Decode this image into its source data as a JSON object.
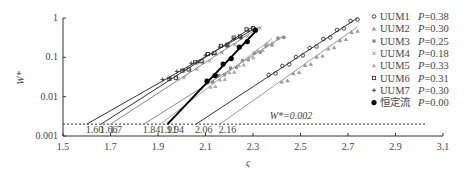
{
  "chart_data": {
    "type": "scatter",
    "title": "",
    "xlabel": "ς",
    "ylabel": "W*",
    "xlim": [
      1.5,
      3.1
    ],
    "ylim": [
      0.001,
      1
    ],
    "yscale": "log",
    "xticks": [
      "1.5",
      "1.7",
      "1.9",
      "2.1",
      "2.3",
      "2.5",
      "2.7",
      "2.9",
      "3.1"
    ],
    "yticks": [
      "0.001",
      "0.01",
      "0.1",
      "1"
    ],
    "grid": false,
    "legend_position": "right",
    "threshold": {
      "label": "W*=0.002",
      "y": 0.002,
      "style": "dotted"
    },
    "intercept_labels": [
      {
        "text": "1.60",
        "x": 1.6,
        "color": "#555555"
      },
      {
        "text": "1.66",
        "x": 1.66,
        "color": "#222222"
      },
      {
        "text": "1.7",
        "x": 1.7,
        "color": "#999999"
      },
      {
        "text": "1.84",
        "x": 1.84,
        "color": "#999999"
      },
      {
        "text": "1.91",
        "x": 1.91,
        "color": "#888888"
      },
      {
        "text": "1.94",
        "x": 1.94,
        "color": "#222222"
      },
      {
        "text": "2.06",
        "x": 2.06,
        "color": "#222222"
      },
      {
        "text": "2.16",
        "x": 2.16,
        "color": "#999999"
      }
    ],
    "series": [
      {
        "name": "UUM1",
        "P": "P=0.38",
        "marker": "circle-open",
        "color": "#333333",
        "fit": {
          "x0": 2.06,
          "x1": 2.74,
          "y1": 1.0
        }
      },
      {
        "name": "UUM2",
        "P": "P=0.30",
        "marker": "triangle",
        "color": "#999999",
        "fit": {
          "x0": 2.16,
          "x1": 2.74,
          "y1": 0.6
        }
      },
      {
        "name": "UUM3",
        "P": "P=0.25",
        "marker": "square",
        "color": "#888888",
        "fit": {
          "x0": 1.84,
          "x1": 2.43,
          "y1": 0.35
        }
      },
      {
        "name": "UUM4",
        "P": "P=0.18",
        "marker": "cross",
        "color": "#888888",
        "fit": {
          "x0": 1.7,
          "x1": 2.33,
          "y1": 0.6
        }
      },
      {
        "name": "UUM5",
        "P": "P=0.33",
        "marker": "triangle",
        "color": "#aaaaaa",
        "fit": {
          "x0": 1.91,
          "x1": 2.38,
          "y1": 0.3
        }
      },
      {
        "name": "UUM6",
        "P": "P=0.31",
        "marker": "square-open",
        "color": "#333333",
        "fit": {
          "x0": 1.66,
          "x1": 2.3,
          "y1": 0.6
        }
      },
      {
        "name": "UUM7",
        "P": "P=0.30",
        "marker": "plus",
        "color": "#333333",
        "fit": {
          "x0": 1.6,
          "x1": 2.31,
          "y1": 0.55
        }
      },
      {
        "name": "恒定流",
        "P": "P=0.00",
        "marker": "dot",
        "color": "#000000",
        "fit": {
          "x0": 1.94,
          "x1": 2.31,
          "y1": 0.45
        }
      }
    ]
  },
  "legend": {
    "items": [
      {
        "label": "UUM1",
        "p": "P=0.38"
      },
      {
        "label": "UUM2",
        "p": "P=0.30"
      },
      {
        "label": "UUM3",
        "p": "P=0.25"
      },
      {
        "label": "UUM4",
        "p": "P=0.18"
      },
      {
        "label": "UUM5",
        "p": "P=0.33"
      },
      {
        "label": "UUM6",
        "p": "P=0.31"
      },
      {
        "label": "UUM7",
        "p": "P=0.30"
      },
      {
        "label": "恒定流",
        "p": "P=0.00"
      }
    ]
  },
  "axes": {
    "xlabel": "ς",
    "ylabel": "W*",
    "threshold_label": "W*=0.002"
  }
}
